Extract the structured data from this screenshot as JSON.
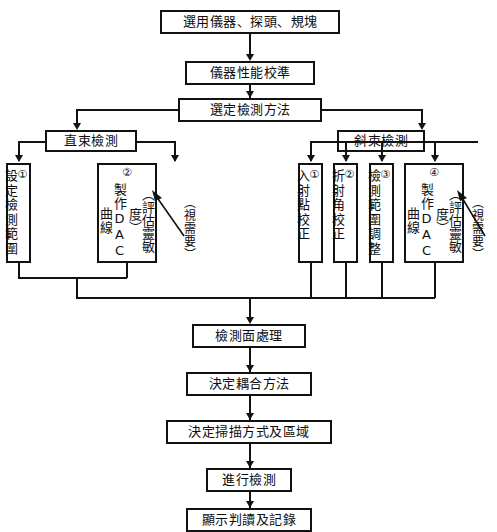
{
  "figure": {
    "caption": "圖 4-14　超音波檢測流程圖",
    "width": 497,
    "height": 532,
    "line_color": "#121212",
    "background": "#ffffff"
  },
  "nodes": {
    "select_equipment": "選用儀器、探頭、規塊",
    "calibrate_performance": "儀器性能校準",
    "select_method": "選定檢測方法",
    "straight_beam": "直束檢測",
    "angle_beam": "斜束檢測",
    "surface_treatment": "檢測面處理",
    "couplant_method": "決定耦合方法",
    "scan_mode_area": "決定掃描方式及區域",
    "perform_inspection": "進行檢測",
    "display_record": "顯示判讀及記錄"
  },
  "straight_branch": {
    "steps": [
      {
        "num": "①",
        "text": "設定檢測範圍"
      },
      {
        "num": "②",
        "main": "製作",
        "latin": "DAC",
        "tail": "曲線",
        "paren": "（評估靈敏度）"
      }
    ],
    "annotation": "（視需要）"
  },
  "angle_branch": {
    "steps": [
      {
        "num": "①",
        "text": "入射點校正"
      },
      {
        "num": "②",
        "text": "折射角校正"
      },
      {
        "num": "③",
        "text": "檢測範圍調整"
      },
      {
        "num": "④",
        "main": "製作",
        "latin": "DAC",
        "tail": "曲線",
        "paren": "（評估靈敏度）"
      }
    ],
    "annotation": "（視需要）"
  }
}
